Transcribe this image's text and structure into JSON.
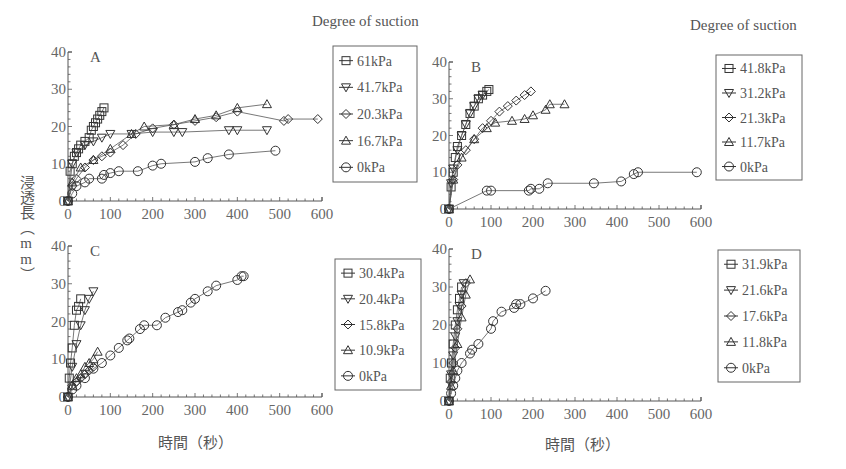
{
  "figure": {
    "y_axis_label": "浸透長（mm）",
    "x_axis_label": "時間（秒）",
    "legend_title": "Degree of suction"
  },
  "chart_data": [
    {
      "panel": "A",
      "type": "scatter",
      "xlabel": "時間（秒）",
      "ylabel": "浸透長（mm）",
      "xlim": [
        0,
        600
      ],
      "ylim": [
        0,
        40
      ],
      "xticks": [
        0,
        100,
        200,
        300,
        400,
        500,
        600
      ],
      "yticks": [
        0,
        10,
        20,
        30,
        40
      ],
      "legend_title": "Degree of suction",
      "legend_position": "right",
      "grid": false,
      "series": [
        {
          "name": "61kPa",
          "marker": "square",
          "x": [
            0,
            5,
            10,
            15,
            20,
            25,
            30,
            40,
            50,
            55,
            60,
            65,
            70,
            75,
            80,
            85
          ],
          "y": [
            0,
            8,
            10,
            12,
            13,
            14,
            15,
            16,
            17,
            19,
            20,
            21,
            22,
            23,
            24,
            25
          ]
        },
        {
          "name": "41.7kPa",
          "marker": "triangle-down",
          "x": [
            0,
            10,
            20,
            40,
            60,
            80,
            100,
            150,
            200,
            250,
            270,
            380,
            400,
            470
          ],
          "y": [
            0,
            10,
            13,
            15,
            16,
            17,
            18,
            18,
            18.5,
            18.5,
            18.5,
            19,
            19,
            19
          ]
        },
        {
          "name": "20.3kPa",
          "marker": "diamond",
          "x": [
            0,
            10,
            20,
            40,
            60,
            80,
            100,
            130,
            160,
            200,
            250,
            300,
            350,
            400,
            510,
            520,
            590
          ],
          "y": [
            0,
            4,
            6,
            9,
            11,
            12,
            13,
            15,
            18,
            19.5,
            20.5,
            21.5,
            22.5,
            24,
            21.5,
            22,
            22
          ]
        },
        {
          "name": "16.7kPa",
          "marker": "triangle-up",
          "x": [
            0,
            10,
            30,
            60,
            100,
            150,
            180,
            250,
            300,
            350,
            400,
            470
          ],
          "y": [
            0,
            5,
            9,
            11,
            14,
            18,
            20,
            20.5,
            22,
            23,
            25,
            26
          ]
        },
        {
          "name": "0kPa",
          "marker": "circle",
          "x": [
            0,
            10,
            20,
            40,
            50,
            80,
            85,
            100,
            120,
            165,
            200,
            220,
            300,
            330,
            380,
            490
          ],
          "y": [
            0,
            2,
            4,
            5,
            6,
            6,
            7,
            7.5,
            8,
            8,
            9.5,
            10,
            10.5,
            11.5,
            12.5,
            13.5
          ]
        }
      ]
    },
    {
      "panel": "B",
      "type": "scatter",
      "xlabel": "時間（秒）",
      "ylabel": "浸透長（mm）",
      "xlim": [
        0,
        600
      ],
      "ylim": [
        0,
        40
      ],
      "xticks": [
        0,
        100,
        200,
        300,
        400,
        500,
        600
      ],
      "yticks": [
        0,
        10,
        20,
        30,
        40
      ],
      "legend_title": "Degree of suction",
      "legend_position": "right",
      "grid": false,
      "series": [
        {
          "name": "41.8kPa",
          "marker": "square",
          "x": [
            0,
            5,
            10,
            15,
            20,
            30,
            40,
            50,
            60,
            70,
            80,
            90,
            95
          ],
          "y": [
            0,
            6,
            10,
            14,
            17,
            20,
            23,
            26,
            28,
            30,
            31,
            32,
            32.5
          ]
        },
        {
          "name": "31.2kPa",
          "marker": "triangle-down",
          "x": [
            0,
            5,
            10,
            20,
            30,
            40,
            50,
            60,
            70,
            80
          ],
          "y": [
            0,
            7,
            11,
            16,
            20,
            23,
            26,
            28,
            30,
            31
          ]
        },
        {
          "name": "21.3kPa",
          "marker": "diamond",
          "x": [
            0,
            10,
            20,
            40,
            60,
            80,
            100,
            120,
            140,
            160,
            180,
            195
          ],
          "y": [
            0,
            8,
            12,
            16,
            19,
            22,
            24,
            26.5,
            28,
            29.5,
            31,
            32
          ]
        },
        {
          "name": "11.7kPa",
          "marker": "triangle-up",
          "x": [
            0,
            10,
            30,
            60,
            90,
            110,
            150,
            180,
            200,
            230,
            240,
            275
          ],
          "y": [
            0,
            8,
            14,
            19,
            22,
            23.5,
            24,
            24.5,
            25.5,
            27,
            28.5,
            28.5
          ]
        },
        {
          "name": "0kPa",
          "marker": "circle",
          "x": [
            0,
            90,
            100,
            190,
            195,
            215,
            235,
            345,
            410,
            440,
            450,
            590
          ],
          "y": [
            0,
            5,
            5,
            5,
            5.5,
            5.5,
            7,
            7,
            7.5,
            9.5,
            10,
            10
          ]
        }
      ]
    },
    {
      "panel": "C",
      "type": "scatter",
      "xlabel": "時間（秒）",
      "ylabel": "浸透長（mm）",
      "xlim": [
        0,
        600
      ],
      "ylim": [
        0,
        40
      ],
      "xticks": [
        0,
        100,
        200,
        300,
        400,
        500,
        600
      ],
      "yticks": [
        0,
        10,
        20,
        30,
        40
      ],
      "legend_title": "",
      "legend_position": "right",
      "grid": false,
      "series": [
        {
          "name": "30.4kPa",
          "marker": "square",
          "x": [
            0,
            3,
            6,
            10,
            15,
            20,
            25,
            30
          ],
          "y": [
            0,
            5,
            9,
            13,
            19,
            23,
            24,
            26
          ]
        },
        {
          "name": "20.4kPa",
          "marker": "triangle-down",
          "x": [
            0,
            10,
            20,
            30,
            40,
            50,
            60
          ],
          "y": [
            0,
            8,
            14,
            19,
            23,
            26,
            28
          ]
        },
        {
          "name": "15.8kPa",
          "marker": "diamond",
          "x": [
            0,
            10,
            20,
            30,
            40,
            50,
            60
          ],
          "y": [
            0,
            3,
            4,
            5,
            6,
            7,
            8
          ]
        },
        {
          "name": "10.9kPa",
          "marker": "triangle-up",
          "x": [
            0,
            10,
            20,
            30,
            40,
            50,
            60,
            70
          ],
          "y": [
            0,
            3,
            5,
            6,
            8,
            9,
            10,
            12
          ]
        },
        {
          "name": "0kPa",
          "marker": "circle",
          "x": [
            0,
            10,
            20,
            40,
            60,
            80,
            100,
            120,
            140,
            145,
            170,
            180,
            210,
            230,
            260,
            270,
            290,
            300,
            330,
            350,
            400,
            410,
            415
          ],
          "y": [
            0,
            2,
            3,
            5,
            7.5,
            9,
            11,
            13,
            15,
            15.5,
            18,
            19,
            19,
            21,
            22.5,
            23,
            25,
            26,
            28,
            29.5,
            31,
            32,
            32
          ]
        }
      ]
    },
    {
      "panel": "D",
      "type": "scatter",
      "xlabel": "時間（秒）",
      "ylabel": "浸透長（mm）",
      "xlim": [
        0,
        600
      ],
      "ylim": [
        0,
        40
      ],
      "xticks": [
        0,
        100,
        200,
        300,
        400,
        500,
        600
      ],
      "yticks": [
        0,
        10,
        20,
        30,
        40
      ],
      "legend_title": "",
      "legend_position": "right",
      "grid": false,
      "series": [
        {
          "name": "31.9kPa",
          "marker": "square",
          "x": [
            0,
            3,
            6,
            10,
            15,
            20,
            25,
            30
          ],
          "y": [
            0,
            6,
            10,
            15,
            20,
            24,
            27,
            30
          ]
        },
        {
          "name": "21.6kPa",
          "marker": "triangle-down",
          "x": [
            0,
            5,
            10,
            15,
            20,
            25,
            30,
            35
          ],
          "y": [
            0,
            7,
            12,
            17,
            21,
            25,
            28,
            31
          ]
        },
        {
          "name": "17.6kPa",
          "marker": "diamond",
          "x": [
            0,
            5,
            10,
            15,
            20,
            30,
            40
          ],
          "y": [
            0,
            5,
            10,
            14,
            19,
            25,
            31
          ]
        },
        {
          "name": "11.8kPa",
          "marker": "triangle-up",
          "x": [
            0,
            5,
            10,
            20,
            30,
            40,
            50
          ],
          "y": [
            0,
            4,
            8,
            15,
            22,
            28,
            32
          ]
        },
        {
          "name": "0kPa",
          "marker": "circle",
          "x": [
            0,
            5,
            10,
            15,
            20,
            30,
            50,
            55,
            70,
            100,
            105,
            125,
            155,
            160,
            170,
            200,
            230
          ],
          "y": [
            0,
            2,
            4,
            6,
            8,
            10,
            12.5,
            13.5,
            15,
            19,
            21,
            23.5,
            24.5,
            25.5,
            25.5,
            27,
            29
          ]
        }
      ]
    }
  ]
}
